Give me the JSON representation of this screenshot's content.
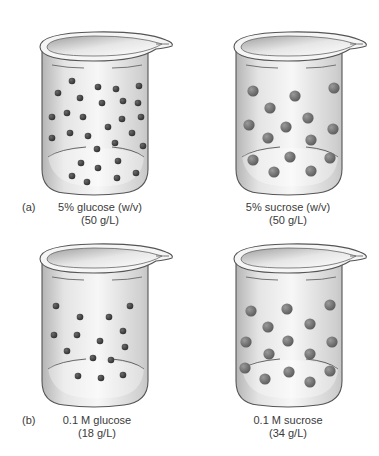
{
  "figure": {
    "panels": [
      {
        "letter": "(a)",
        "beakers": [
          {
            "solute": "glucose",
            "caption_line1": "5% glucose (w/v)",
            "caption_line2": "(50 g/L)",
            "particle_size": "small",
            "particle_count": 29
          },
          {
            "solute": "sucrose",
            "caption_line1": "5% sucrose (w/v)",
            "caption_line2": "(50 g/L)",
            "particle_size": "large",
            "particle_count": 15
          }
        ]
      },
      {
        "letter": "(b)",
        "beakers": [
          {
            "solute": "glucose",
            "caption_line1": "0.1 M glucose",
            "caption_line2": "(18 g/L)",
            "particle_size": "small",
            "particle_count": 15
          },
          {
            "solute": "sucrose",
            "caption_line1": "0.1 M sucrose",
            "caption_line2": "(34 g/L)",
            "particle_size": "large",
            "particle_count": 15
          }
        ]
      }
    ],
    "colors": {
      "small_particle": "#3a3a3a",
      "large_particle": "#6e6e6e",
      "beaker_outline": "#555555",
      "liquid_light": "#f2f2f2",
      "liquid_dark": "#bdbdbd"
    }
  }
}
